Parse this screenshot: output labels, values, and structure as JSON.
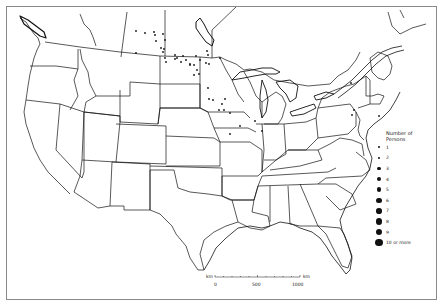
{
  "map": {
    "title": "",
    "region": "Contiguous United States and southern Canada",
    "stroke_color": "#111111",
    "background": "#ffffff"
  },
  "legend": {
    "title_line1": "Number of",
    "title_line2": "Persons",
    "items": [
      {
        "label": "1",
        "size": 1.2
      },
      {
        "label": "2",
        "size": 1.6
      },
      {
        "label": "3",
        "size": 2.0
      },
      {
        "label": "4",
        "size": 2.4
      },
      {
        "label": "5",
        "size": 2.7
      },
      {
        "label": "6",
        "size": 3.0
      },
      {
        "label": "7",
        "size": 3.3
      },
      {
        "label": "8",
        "size": 3.6
      },
      {
        "label": "9",
        "size": 3.9
      },
      {
        "label": "10 or more",
        "size": 4.4
      }
    ]
  },
  "scale": {
    "unit_left": "km",
    "unit_right": "km",
    "ticks": [
      "0",
      "500",
      "1000"
    ]
  },
  "points": [
    {
      "x": 136,
      "y": 31
    },
    {
      "x": 145,
      "y": 33
    },
    {
      "x": 136,
      "y": 53
    },
    {
      "x": 154,
      "y": 32
    },
    {
      "x": 155,
      "y": 35
    },
    {
      "x": 163,
      "y": 34
    },
    {
      "x": 165,
      "y": 40
    },
    {
      "x": 156,
      "y": 41
    },
    {
      "x": 164,
      "y": 49
    },
    {
      "x": 165,
      "y": 58
    },
    {
      "x": 166,
      "y": 62
    },
    {
      "x": 161,
      "y": 48
    },
    {
      "x": 163,
      "y": 52
    },
    {
      "x": 175,
      "y": 59
    },
    {
      "x": 175,
      "y": 55
    },
    {
      "x": 177,
      "y": 58
    },
    {
      "x": 183,
      "y": 56
    },
    {
      "x": 186,
      "y": 60
    },
    {
      "x": 181,
      "y": 62
    },
    {
      "x": 190,
      "y": 64
    },
    {
      "x": 194,
      "y": 65
    },
    {
      "x": 190,
      "y": 65
    },
    {
      "x": 196,
      "y": 56
    },
    {
      "x": 200,
      "y": 60
    },
    {
      "x": 206,
      "y": 63
    },
    {
      "x": 207,
      "y": 51
    },
    {
      "x": 208,
      "y": 55
    },
    {
      "x": 220,
      "y": 58
    },
    {
      "x": 209,
      "y": 64
    },
    {
      "x": 197,
      "y": 70
    },
    {
      "x": 199,
      "y": 74
    },
    {
      "x": 194,
      "y": 75
    },
    {
      "x": 208,
      "y": 88
    },
    {
      "x": 213,
      "y": 100
    },
    {
      "x": 209,
      "y": 99
    },
    {
      "x": 225,
      "y": 99
    },
    {
      "x": 222,
      "y": 104
    },
    {
      "x": 219,
      "y": 110
    },
    {
      "x": 224,
      "y": 110
    },
    {
      "x": 230,
      "y": 113
    },
    {
      "x": 240,
      "y": 126
    },
    {
      "x": 230,
      "y": 134
    },
    {
      "x": 255,
      "y": 121
    },
    {
      "x": 262,
      "y": 131
    },
    {
      "x": 351,
      "y": 83
    },
    {
      "x": 354,
      "y": 110
    },
    {
      "x": 352,
      "y": 115
    },
    {
      "x": 379,
      "y": 116
    }
  ]
}
